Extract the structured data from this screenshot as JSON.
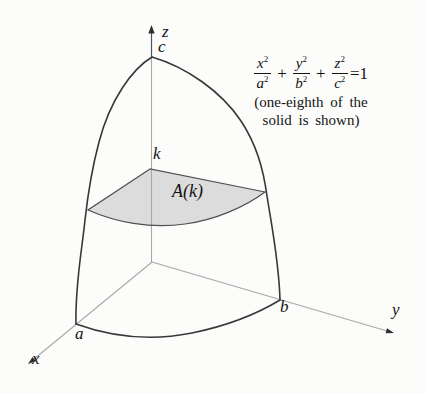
{
  "colors": {
    "background": "#fcfcfb",
    "outline": "#383838",
    "axis": "#a8a8a8",
    "section_fill": "#dcdcdc",
    "section_edge": "#4f4f4f",
    "arrow": "#2e2e2e",
    "text": "#141414"
  },
  "labels": {
    "z_axis": "z",
    "z_intercept": "c",
    "slice_height": "k",
    "slice_area": "A(k)",
    "x_intercept": "a",
    "y_intercept": "b",
    "x_axis": "x",
    "y_axis": "y"
  },
  "equation": {
    "num1": "x",
    "den1": "a",
    "num2": "y",
    "den2": "b",
    "num3": "z",
    "den3": "c",
    "exponent": "2",
    "plus": "+",
    "equals": "=1"
  },
  "note": {
    "line1": "(one-eighth of the",
    "line2": "solid is shown)"
  }
}
